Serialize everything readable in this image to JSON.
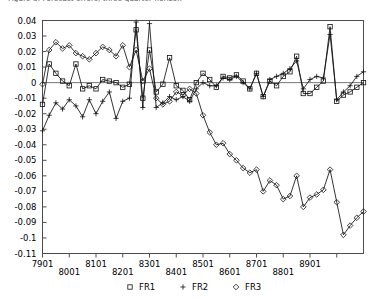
{
  "clipped_header_text": "Figure 3. Forecast errors, three quarter horizon",
  "chart_data": {
    "type": "line",
    "title": "",
    "xlabel": "",
    "ylabel": "",
    "xlim": [
      1,
      49
    ],
    "ylim": [
      -0.11,
      0.04
    ],
    "ytick_values": [
      0.04,
      0.03,
      0.02,
      0.01,
      0,
      -0.01,
      -0.02,
      -0.03,
      -0.04,
      -0.05,
      -0.06,
      -0.07,
      -0.08,
      -0.09,
      -0.1,
      -0.11
    ],
    "ytick_labels": [
      "0.04",
      "0.03",
      "0.02",
      "0.01",
      "0",
      "-0.01",
      "-0.02",
      "-0.03",
      "-0.04",
      "-0.05",
      "-0.06",
      "-0.07",
      "-0.08",
      "-0.09",
      "-0.1",
      "-0.11"
    ],
    "xtick_values": [
      1,
      5,
      9,
      13,
      17,
      21,
      25,
      29,
      33,
      37,
      41,
      45
    ],
    "xtick_labels": [
      "7901",
      "8001",
      "8101",
      "8201",
      "8301",
      "8401",
      "8501",
      "8601",
      "8701",
      "8801",
      "8901",
      ""
    ],
    "xtick_rows": [
      0,
      1,
      0,
      1,
      0,
      1,
      0,
      1,
      0,
      1,
      0,
      1
    ],
    "grid": false,
    "zero_line": true,
    "legend_position": "bottom",
    "legend": [
      {
        "name": "FR1",
        "marker": "square"
      },
      {
        "name": "FR2",
        "marker": "plus"
      },
      {
        "name": "FR3",
        "marker": "diamond"
      }
    ],
    "x": [
      1,
      2,
      3,
      4,
      5,
      6,
      7,
      8,
      9,
      10,
      11,
      12,
      13,
      14,
      15,
      16,
      17,
      18,
      19,
      20,
      21,
      22,
      23,
      24,
      25,
      26,
      27,
      28,
      29,
      30,
      31,
      32,
      33,
      34,
      35,
      36,
      37,
      38,
      39,
      40,
      41,
      42,
      43,
      44,
      45,
      46,
      47,
      48,
      49
    ],
    "series": [
      {
        "name": "FR1",
        "marker": "square",
        "values": [
          -0.014,
          0.012,
          0.006,
          0.001,
          -0.002,
          0.012,
          -0.004,
          -0.002,
          -0.004,
          0.002,
          0.001,
          0.0,
          -0.003,
          -0.001,
          0.034,
          -0.01,
          0.021,
          -0.006,
          -0.001,
          0.016,
          -0.002,
          -0.005,
          -0.011,
          0.0,
          0.006,
          0.002,
          -0.003,
          0.004,
          0.003,
          0.005,
          0.001,
          -0.004,
          0.006,
          -0.009,
          0.001,
          -0.002,
          0.004,
          0.007,
          0.017,
          -0.007,
          -0.007,
          -0.003,
          0.001,
          0.036,
          -0.012,
          -0.008,
          -0.006,
          -0.003,
          0.0
        ]
      },
      {
        "name": "FR2",
        "marker": "plus",
        "values": [
          -0.031,
          -0.021,
          -0.013,
          -0.017,
          -0.011,
          -0.015,
          -0.022,
          -0.011,
          -0.02,
          -0.012,
          -0.006,
          -0.023,
          -0.012,
          -0.01,
          0.039,
          -0.016,
          0.038,
          -0.016,
          -0.013,
          -0.009,
          -0.011,
          -0.009,
          -0.012,
          -0.004,
          0.0,
          -0.002,
          -0.002,
          0.003,
          0.002,
          0.004,
          0.0,
          -0.004,
          0.006,
          -0.009,
          0.002,
          0.004,
          0.006,
          0.009,
          0.014,
          -0.004,
          0.002,
          0.004,
          0.003,
          0.031,
          -0.011,
          -0.006,
          -0.002,
          0.004,
          0.007
        ]
      },
      {
        "name": "FR3",
        "marker": "diamond",
        "values": [
          -0.001,
          0.021,
          0.026,
          0.022,
          0.024,
          0.019,
          0.017,
          0.015,
          0.019,
          0.023,
          0.021,
          0.017,
          0.024,
          0.01,
          0.021,
          0.001,
          0.009,
          -0.01,
          -0.014,
          -0.012,
          -0.006,
          -0.008,
          -0.004,
          -0.007,
          -0.021,
          -0.032,
          -0.04,
          -0.039,
          -0.046,
          -0.05,
          -0.055,
          -0.058,
          -0.056,
          -0.07,
          -0.063,
          -0.066,
          -0.075,
          -0.073,
          -0.06,
          -0.08,
          -0.074,
          -0.072,
          -0.069,
          -0.056,
          -0.077,
          -0.098,
          -0.092,
          -0.087,
          -0.083
        ]
      }
    ]
  }
}
